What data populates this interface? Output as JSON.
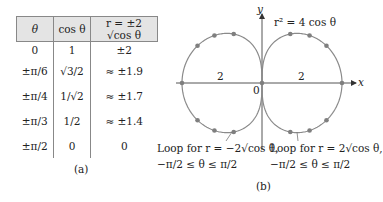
{
  "table": {
    "headers": [
      "θ",
      "cos θ",
      "r = ±2 √cos θ"
    ],
    "rows": [
      [
        "0",
        "1",
        "±2"
      ],
      [
        "±π/6",
        "√3/2",
        "≈ ±1.9"
      ],
      [
        "±π/4",
        "1/√2",
        "≈ ±1.7"
      ],
      [
        "±π/3",
        "1/2",
        "≈ ±1.4"
      ],
      [
        "±π/2",
        "0",
        "0"
      ]
    ],
    "caption": "(a)"
  },
  "graph": {
    "equation": "r² = 4 cos θ",
    "x_axis_label": "x",
    "y_axis_label": "y",
    "origin_label": "0",
    "left_distance_label": "2",
    "right_distance_label": "2",
    "left_annotation_line1": "Loop for r = −2√cos θ,",
    "left_annotation_line2": "−π/2 ≤ θ ≤ π/2",
    "right_annotation_line1": "Loop for r = 2√cos θ,",
    "right_annotation_line2": "−π/2 ≤ θ ≤ π/2",
    "caption": "(b)",
    "curve_color": "#8a8a8a",
    "dot_color": "#7f7f7f"
  }
}
